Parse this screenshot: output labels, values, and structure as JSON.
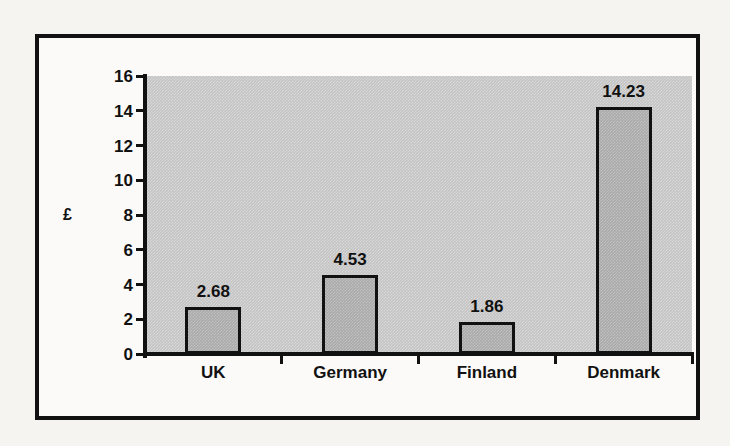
{
  "chart_data": {
    "type": "bar",
    "title": "",
    "subtitle": "",
    "xlabel": "",
    "ylabel": "£",
    "categories": [
      "UK",
      "Germany",
      "Finland",
      "Denmark"
    ],
    "values": [
      2.68,
      4.53,
      1.86,
      14.23
    ],
    "value_labels": [
      "2.68",
      "4.53",
      "1.86",
      "14.23"
    ],
    "series": [
      {
        "name": "",
        "values": [
          2.68,
          4.53,
          1.86,
          14.23
        ]
      }
    ],
    "ylim": [
      0,
      16
    ],
    "ytick_step": 2,
    "ytick_labels": [
      "16",
      "14",
      "12",
      "10",
      "8",
      "6",
      "4",
      "2",
      "0"
    ],
    "ytick_values": [
      16,
      14,
      12,
      10,
      8,
      6,
      4,
      2,
      0
    ],
    "grid": false,
    "legend": false,
    "legend_position": "none",
    "plot_background_color": "#c4c4c4",
    "bar_fill_color": "#aaaaaa",
    "bar_outline_color": "#111111",
    "frame_color": "#111111",
    "page_background_color": "#f6f4f0"
  }
}
